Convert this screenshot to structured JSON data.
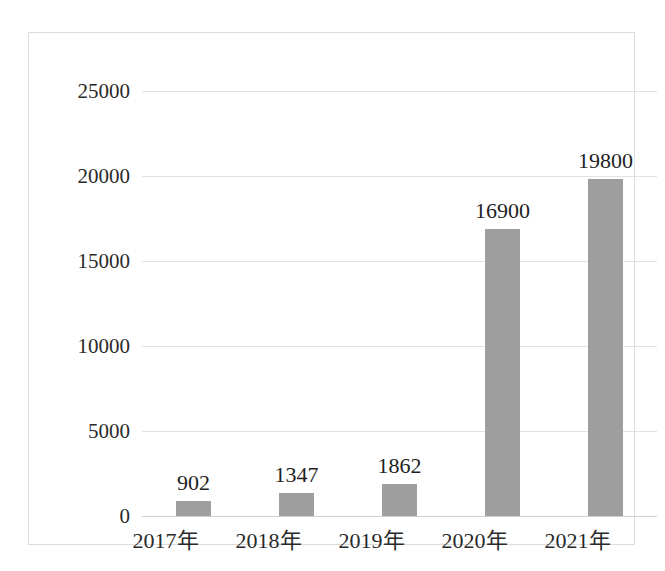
{
  "chart_data": {
    "type": "bar",
    "title": "",
    "subtitle": "",
    "xlabel": "",
    "ylabel": "",
    "categories": [
      "2017年",
      "2018年",
      "2019年",
      "2020年",
      "2021年"
    ],
    "values": [
      902,
      1347,
      1862,
      16900,
      19800
    ],
    "data_labels": [
      "902",
      "1347",
      "1862",
      "16900",
      "19800"
    ],
    "ylim": [
      0,
      25000
    ],
    "ytick_values": [
      0,
      5000,
      10000,
      15000,
      20000,
      25000
    ],
    "ytick_labels": [
      "0",
      "5000",
      "10000",
      "15000",
      "20000",
      "25000"
    ],
    "grid": true,
    "grid_orientation": "horizontal",
    "legend": false,
    "legend_position": "none",
    "annotations": []
  },
  "style": {
    "bar_color": "#9e9e9e",
    "gridline_color": "#e2e2e2",
    "axis_color": "#d2d2d2",
    "frame_color": "#dcdcdc",
    "background_color": "#ffffff",
    "text_color": "#2a2a2a"
  }
}
